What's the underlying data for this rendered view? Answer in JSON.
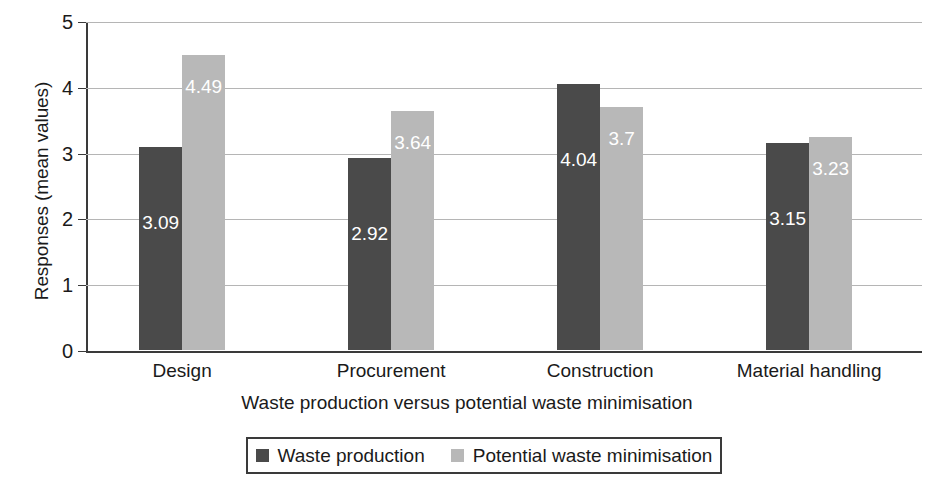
{
  "chart_data": {
    "type": "bar",
    "title": "",
    "subtitle": "",
    "xlabel": "Waste production versus potential waste minimisation",
    "ylabel": "Responses (mean values)",
    "categories": [
      "Design",
      "Procurement",
      "Construction",
      "Material handling"
    ],
    "series": [
      {
        "name": "Waste production",
        "color": "#4a4a4a",
        "values": [
          3.09,
          2.92,
          4.04,
          3.15
        ],
        "labels": [
          "3.09",
          "2.92",
          "4.04",
          "3.15"
        ]
      },
      {
        "name": "Potential waste minimisation",
        "color": "#b8b8b8",
        "values": [
          4.49,
          3.64,
          3.7,
          3.23
        ],
        "labels": [
          "4.49",
          "3.64",
          "3.7",
          "3.23"
        ]
      }
    ],
    "ylim": [
      0,
      5
    ],
    "yticks": [
      0,
      1,
      2,
      3,
      4,
      5
    ],
    "ytick_labels": [
      "0",
      "1",
      "2",
      "3",
      "4",
      "5"
    ],
    "grid": true,
    "legend_position": "bottom",
    "value_labels_inside_bars": true,
    "value_label_color": "#ffffff"
  },
  "axes": {
    "y_title": "Responses (mean values)",
    "x_title": "Waste production versus potential waste minimisation"
  },
  "legend": {
    "entries": [
      {
        "label": "Waste production",
        "color": "#4a4a4a"
      },
      {
        "label": "Potential waste minimisation",
        "color": "#b8b8b8"
      }
    ]
  }
}
